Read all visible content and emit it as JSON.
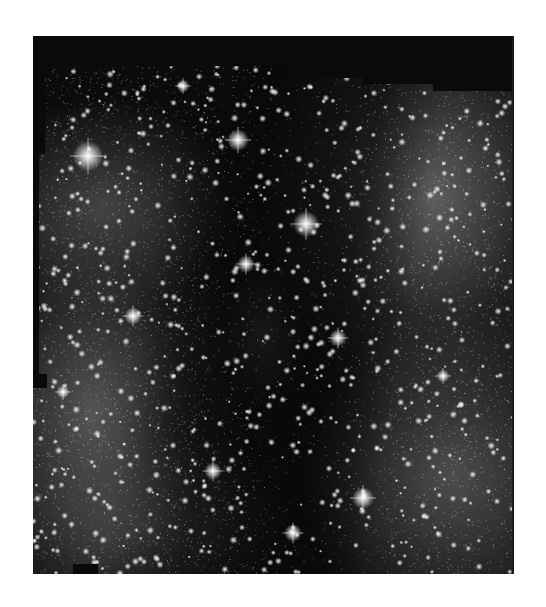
{
  "image": {
    "subject": "astronomical starfield mosaic",
    "description": "Grayscale deep-sky image of a dense Milky Way star field with a dark nebula lane running diagonally through the center; mosaic tile edges visible along the top and left",
    "background_color": "#ffffff",
    "frame": {
      "left": 33,
      "top": 36,
      "width": 481,
      "height": 538
    },
    "palette": {
      "void": "#0a0a0a",
      "dark_lane": "#141414",
      "diffuse_glow": "#5a5a5a",
      "bright_glow": "#7a7a7a",
      "star": "#ffffff"
    },
    "bright_stars": [
      {
        "x": 55,
        "y": 120,
        "r": 7
      },
      {
        "x": 205,
        "y": 104,
        "r": 5
      },
      {
        "x": 273,
        "y": 188,
        "r": 6
      },
      {
        "x": 213,
        "y": 228,
        "r": 4
      },
      {
        "x": 100,
        "y": 280,
        "r": 4
      },
      {
        "x": 305,
        "y": 302,
        "r": 4
      },
      {
        "x": 330,
        "y": 462,
        "r": 5
      },
      {
        "x": 260,
        "y": 497,
        "r": 4
      },
      {
        "x": 180,
        "y": 435,
        "r": 4
      },
      {
        "x": 410,
        "y": 340,
        "r": 3
      },
      {
        "x": 30,
        "y": 356,
        "r": 3
      },
      {
        "x": 150,
        "y": 50,
        "r": 3
      }
    ],
    "mosaic_masks": [
      {
        "left": 0,
        "top": 0,
        "width": 481,
        "height": 30
      },
      {
        "left": 0,
        "top": 0,
        "width": 12,
        "height": 118
      },
      {
        "left": 0,
        "top": 118,
        "width": 6,
        "height": 220
      },
      {
        "left": 0,
        "top": 338,
        "width": 14,
        "height": 14
      },
      {
        "left": 260,
        "top": 0,
        "width": 221,
        "height": 42
      },
      {
        "left": 330,
        "top": 0,
        "width": 151,
        "height": 48
      },
      {
        "left": 400,
        "top": 0,
        "width": 81,
        "height": 55
      },
      {
        "left": 40,
        "top": 528,
        "width": 25,
        "height": 10
      }
    ]
  }
}
